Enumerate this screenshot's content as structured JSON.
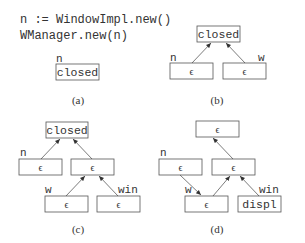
{
  "code": {
    "line1": "n := WindowImpl.new()",
    "line2": "WManager.new(n)"
  },
  "panels": {
    "a": {
      "caption": "(a)",
      "var_n": "n",
      "root": "closed"
    },
    "b": {
      "caption": "(b)",
      "var_n": "n",
      "var_w": "w",
      "root": "closed",
      "left": "ϵ",
      "right": "ϵ"
    },
    "c": {
      "caption": "(c)",
      "var_n": "n",
      "var_w": "w",
      "var_win": "win",
      "root": "closed",
      "left": "ϵ",
      "mid": "ϵ",
      "bottom_left": "ϵ",
      "bottom_right": "ϵ"
    },
    "d": {
      "caption": "(d)",
      "var_n": "n",
      "var_w": "w",
      "var_win": "win",
      "root": "ϵ",
      "left": "ϵ",
      "mid": "ϵ",
      "bottom_left": "ϵ",
      "bottom_right": "displ"
    }
  }
}
